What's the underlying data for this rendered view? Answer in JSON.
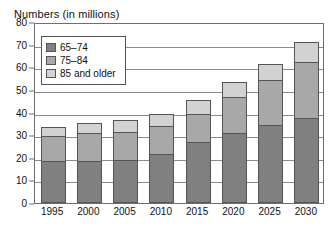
{
  "chart_data": {
    "type": "bar",
    "variant": "stacked-vertical",
    "title": "Numbers (in millions)",
    "xlabel": "",
    "ylabel": "",
    "ylim": [
      0,
      80
    ],
    "ytick_step": 10,
    "yticks": [
      0,
      10,
      20,
      30,
      40,
      50,
      60,
      70,
      80
    ],
    "ytick_labels": [
      "0",
      "10",
      "20",
      "30",
      "40",
      "50",
      "60",
      "70",
      "80"
    ],
    "grid": true,
    "grid_axis": "y",
    "legend_position": "upper-left-inside",
    "categories": [
      "1995",
      "2000",
      "2005",
      "2010",
      "2015",
      "2020",
      "2025",
      "2030"
    ],
    "series": [
      {
        "name": "65–74",
        "color": "#808080",
        "values": [
          18.5,
          18.5,
          19,
          21.5,
          27,
          31,
          34.5,
          37.5
        ]
      },
      {
        "name": "75–84",
        "color": "#a8a8a8",
        "values": [
          11,
          12.5,
          12.5,
          12.5,
          12.5,
          16,
          20,
          25
        ]
      },
      {
        "name": "85 and older",
        "color": "#d2d2d2",
        "values": [
          4,
          4.5,
          5,
          5.5,
          6,
          6.5,
          7,
          8.5
        ]
      }
    ],
    "totals": [
      33.5,
      35.5,
      36.5,
      39.5,
      45.5,
      53.5,
      61.5,
      71
    ]
  },
  "legend": {
    "items": [
      {
        "label": "65–74",
        "color": "#808080"
      },
      {
        "label": "75–84",
        "color": "#a8a8a8"
      },
      {
        "label": "85 and older",
        "color": "#d2d2d2"
      }
    ]
  },
  "colors": {
    "background": "#ffffff",
    "frame": "#6e6e6e",
    "gridline": "#8c8c8c",
    "bar_outline": "#555555",
    "text": "#111111",
    "series_65_74": "#808080",
    "series_75_84": "#a8a8a8",
    "series_85_older": "#d2d2d2"
  }
}
